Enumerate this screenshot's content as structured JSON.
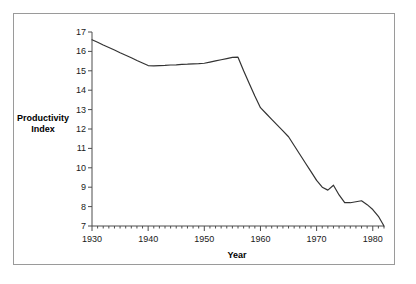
{
  "chart_data": {
    "type": "line",
    "title": "",
    "xlabel": "Year",
    "ylabel": "Productivity Index",
    "xlim": [
      1930,
      1982
    ],
    "ylim": [
      7,
      17
    ],
    "grid": false,
    "legend": null,
    "x_major_ticks": [
      1930,
      1940,
      1950,
      1960,
      1970,
      1980
    ],
    "x_tick_labels": [
      "1930",
      "1940",
      "1950",
      "1960",
      "1970",
      "1980"
    ],
    "x_minor_tick_interval": 1,
    "y_ticks": [
      7,
      8,
      9,
      10,
      11,
      12,
      13,
      14,
      15,
      16,
      17
    ],
    "y_tick_labels": [
      "7",
      "8",
      "9",
      "10",
      "11",
      "12",
      "13",
      "14",
      "15",
      "16",
      "17"
    ],
    "series": [
      {
        "name": "Productivity Index",
        "color": "#333333",
        "x": [
          1930,
          1931,
          1932,
          1933,
          1934,
          1935,
          1936,
          1937,
          1938,
          1939,
          1940,
          1941,
          1942,
          1943,
          1944,
          1945,
          1946,
          1947,
          1948,
          1949,
          1950,
          1951,
          1952,
          1953,
          1954,
          1955,
          1956,
          1957,
          1958,
          1959,
          1960,
          1961,
          1962,
          1963,
          1964,
          1965,
          1966,
          1967,
          1968,
          1969,
          1970,
          1971,
          1972,
          1973,
          1974,
          1975,
          1976,
          1977,
          1978,
          1979,
          1980,
          1981,
          1982
        ],
        "values": [
          16.6,
          16.47,
          16.33,
          16.2,
          16.07,
          15.93,
          15.8,
          15.67,
          15.53,
          15.4,
          15.27,
          15.25,
          15.27,
          15.28,
          15.3,
          15.31,
          15.33,
          15.34,
          15.36,
          15.37,
          15.39,
          15.45,
          15.51,
          15.57,
          15.63,
          15.69,
          15.7,
          15.0,
          14.35,
          13.7,
          13.1,
          12.8,
          12.5,
          12.2,
          11.9,
          11.6,
          11.15,
          10.7,
          10.25,
          9.8,
          9.35,
          9.0,
          8.85,
          9.1,
          8.6,
          8.2,
          8.2,
          8.25,
          8.3,
          8.1,
          7.85,
          7.5,
          7.0
        ]
      }
    ]
  },
  "axes": {
    "y_title_line1": "Productivity",
    "y_title_line2": "Index",
    "x_title": "Year"
  }
}
